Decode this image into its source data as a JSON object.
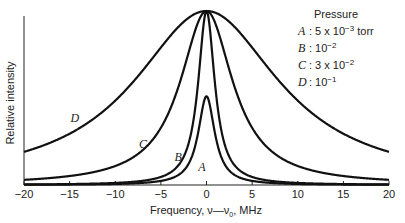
{
  "chart_data": {
    "type": "line",
    "title": "",
    "xlabel": "Frequency, ν—ν₀, MHz",
    "ylabel": "Relative intensity",
    "xlim": [
      -20,
      20
    ],
    "ylim": [
      0,
      1.05
    ],
    "xticks": [
      -20,
      -15,
      -10,
      -5,
      0,
      5,
      10,
      15,
      20
    ],
    "xtick_labels": [
      "−20",
      "−15",
      "−10",
      "−5",
      "0",
      "5",
      "10",
      "15",
      "20"
    ],
    "yticks": [],
    "grid": false,
    "legend_position": "upper right",
    "legend_title": "Pressure",
    "series": [
      {
        "name": "A",
        "label": "A",
        "pressure": "5 x 10⁻³ torr",
        "shape": "lorentzian",
        "peak": 0.51,
        "hwhm_mhz": 1.1,
        "label_pos": [
          -0.9,
          0.08
        ]
      },
      {
        "name": "B",
        "label": "B",
        "pressure": "10⁻²",
        "shape": "lorentzian",
        "peak": 1.0,
        "hwhm_mhz": 1.1,
        "label_pos": [
          -3.5,
          0.14
        ]
      },
      {
        "name": "C",
        "label": "C",
        "pressure": "3 x 10⁻²",
        "shape": "lorentzian",
        "peak": 1.0,
        "hwhm_mhz": 3.5,
        "label_pos": [
          -7.4,
          0.21
        ]
      },
      {
        "name": "D",
        "label": "D",
        "pressure": "10⁻¹",
        "shape": "lorentzian",
        "peak": 1.0,
        "hwhm_mhz": 9.7,
        "label_pos": [
          -14.9,
          0.36
        ]
      }
    ]
  },
  "legend": {
    "title": "Pressure",
    "entries": [
      {
        "key": "A",
        "value": ": 5 x 10",
        "exp": "−3",
        "unit": " torr"
      },
      {
        "key": "B",
        "value": ": 10",
        "exp": "−2",
        "unit": ""
      },
      {
        "key": "C",
        "value": ": 3 x 10",
        "exp": "−2",
        "unit": ""
      },
      {
        "key": "D",
        "value": ": 10",
        "exp": "−1",
        "unit": ""
      }
    ]
  },
  "axes": {
    "xlabel_main": "Frequency, ν—ν",
    "xlabel_sub": "0",
    "xlabel_tail": ", MHz",
    "ylabel": "Relative intensity"
  }
}
